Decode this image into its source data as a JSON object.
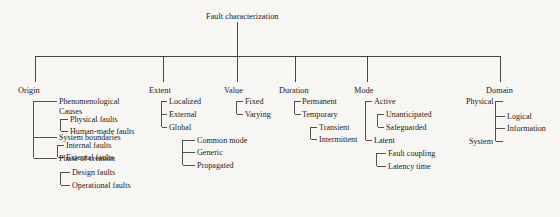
{
  "diagram": {
    "title": "Fault characterization",
    "type": "hierarchical-tree",
    "root": "Fault characterization",
    "branches": [
      {
        "label": "Origin",
        "children": [
          {
            "label": "Phenomenological Causes",
            "children": [
              "Physical faults",
              "Human-made faults"
            ]
          },
          {
            "label": "System boundaries",
            "children": [
              "Internal faults",
              "External faults"
            ]
          },
          {
            "label": "Phase of creation",
            "children": [
              "Design faults",
              "Operational faults"
            ]
          }
        ]
      },
      {
        "label": "Extent",
        "children": [
          {
            "label": "Localized",
            "children": []
          },
          {
            "label": "External",
            "children": []
          },
          {
            "label": "Global",
            "children": [
              "Common mode",
              "Generic",
              "Propagated"
            ]
          }
        ]
      },
      {
        "label": "Value",
        "children": [
          {
            "label": "Fixed",
            "children": []
          },
          {
            "label": "Varying",
            "children": []
          }
        ]
      },
      {
        "label": "Duration",
        "children": [
          {
            "label": "Permanent",
            "children": []
          },
          {
            "label": "Temporary",
            "children": [
              "Transient",
              "Intermittent"
            ]
          }
        ]
      },
      {
        "label": "Mode",
        "children": [
          {
            "label": "Active",
            "children": [
              "Unanticipated",
              "Safeguarded"
            ]
          },
          {
            "label": "Latent",
            "children": [
              "Fault coupling",
              "Latency time"
            ]
          }
        ]
      },
      {
        "label": "Domain",
        "children": [
          {
            "label": "Physical",
            "children": []
          },
          {
            "label": "System",
            "children": []
          },
          {
            "label": "Logical",
            "children": []
          },
          {
            "label": "Information",
            "children": []
          }
        ]
      }
    ]
  },
  "labels": {
    "root": "Fault characterization",
    "origin": "Origin",
    "extent": "Extent",
    "value": "Value",
    "duration": "Duration",
    "mode": "Mode",
    "domain": "Domain",
    "phenomenological_causes": "Phenomenological Causes",
    "physical_faults": "Physical faults",
    "human_made_faults": "Human-made faults",
    "system_boundaries": "System boundaries",
    "internal_faults": "Internal faults",
    "external_faults": "External faults",
    "phase_of_creation": "Phase of creation",
    "design_faults": "Design faults",
    "operational_faults": "Operational faults",
    "localized": "Localized",
    "external": "External",
    "global": "Global",
    "common_mode": "Common mode",
    "generic": "Generic",
    "propagated": "Propagated",
    "fixed": "Fixed",
    "varying": "Varying",
    "permanent": "Permanent",
    "temporary": "Temporary",
    "transient": "Transient",
    "intermittent": "Intermittent",
    "active": "Active",
    "unanticipated": "Unanticipated",
    "safeguarded": "Safeguarded",
    "latent": "Latent",
    "fault_coupling": "Fault coupling",
    "latency_time": "Latency time",
    "physical": "Physical",
    "system": "System",
    "logical": "Logical",
    "information": "Information"
  },
  "colors": {
    "background": "#f7f6f3",
    "line": "#2a2724",
    "text": "#1d1b1a"
  }
}
